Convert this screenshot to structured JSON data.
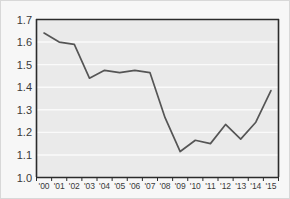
{
  "chart_data": {
    "type": "line",
    "title": "",
    "subtitle": "",
    "xlabel": "",
    "ylabel": "",
    "categories": [
      "'00",
      "'01",
      "'02",
      "'03",
      "'04",
      "'05",
      "'06",
      "'07",
      "'08",
      "'09",
      "'10",
      "'11",
      "'12",
      "'13",
      "'14",
      "'15"
    ],
    "values": [
      1.64,
      1.6,
      1.59,
      1.44,
      1.475,
      1.465,
      1.475,
      1.465,
      1.265,
      1.115,
      1.165,
      1.15,
      1.235,
      1.17,
      1.245,
      1.385
    ],
    "series": [
      {
        "name": "",
        "values": [
          1.64,
          1.6,
          1.59,
          1.44,
          1.475,
          1.465,
          1.475,
          1.465,
          1.265,
          1.115,
          1.165,
          1.15,
          1.235,
          1.17,
          1.245,
          1.385
        ]
      }
    ],
    "ylim": [
      1.0,
      1.7
    ],
    "xlim": [
      "'00",
      "'15"
    ],
    "yticks": [
      1.0,
      1.1,
      1.2,
      1.3,
      1.4,
      1.5,
      1.6,
      1.7
    ],
    "ytick_labels": [
      "1.0",
      "1.1",
      "1.2",
      "1.3",
      "1.4",
      "1.5",
      "1.6",
      "1.7"
    ],
    "xtick_labels": [
      "'00",
      "'01",
      "'02",
      "'03",
      "'04",
      "'05",
      "'06",
      "'07",
      "'08",
      "'09",
      "'10",
      "'11",
      "'12",
      "'13",
      "'14",
      "'15"
    ],
    "grid": true,
    "grid_axis": "y",
    "legend": false,
    "legend_position": "none",
    "annotations": []
  },
  "style": {
    "figure_background": "#f7f7f7",
    "plot_background": "#eaeaea",
    "gridline_color": "#fafafa",
    "line_color": "#555555",
    "axis_color": "#2b2b2b",
    "tick_text_color": "#3a3a3a",
    "border_color": "#d8d8d8"
  }
}
